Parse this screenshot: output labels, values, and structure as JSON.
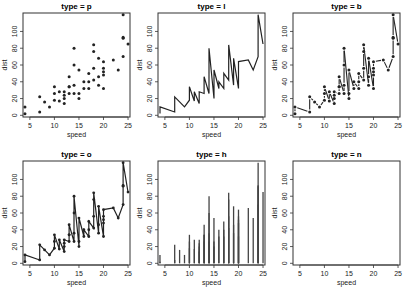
{
  "chart_data": {
    "type": "scatter",
    "dataset": "cars",
    "xlabel": "speed",
    "ylabel": "dist",
    "xlim": [
      4,
      25
    ],
    "ylim": [
      0,
      120
    ],
    "x_ticks": [
      5,
      10,
      15,
      20,
      25
    ],
    "y_ticks": [
      0,
      20,
      40,
      60,
      80,
      100
    ],
    "grid": false,
    "legend": null,
    "speed": [
      4,
      4,
      7,
      7,
      8,
      9,
      10,
      10,
      10,
      11,
      11,
      12,
      12,
      12,
      12,
      13,
      13,
      13,
      13,
      14,
      14,
      14,
      14,
      15,
      15,
      15,
      16,
      16,
      17,
      17,
      17,
      18,
      18,
      18,
      18,
      19,
      19,
      19,
      20,
      20,
      20,
      20,
      20,
      22,
      23,
      24,
      24,
      24,
      24,
      25
    ],
    "dist": [
      2,
      10,
      4,
      22,
      16,
      10,
      18,
      26,
      34,
      17,
      28,
      14,
      20,
      24,
      28,
      26,
      34,
      34,
      46,
      26,
      36,
      60,
      80,
      20,
      26,
      54,
      32,
      40,
      32,
      40,
      50,
      42,
      56,
      76,
      84,
      36,
      46,
      68,
      32,
      48,
      52,
      56,
      64,
      66,
      54,
      70,
      92,
      93,
      120,
      85
    ],
    "panels": [
      {
        "title": "type = p",
        "plot_type": "p",
        "description": "points"
      },
      {
        "title": "type = l",
        "plot_type": "l",
        "description": "lines"
      },
      {
        "title": "type = b",
        "plot_type": "b",
        "description": "both points and lines (broken)"
      },
      {
        "title": "type = o",
        "plot_type": "o",
        "description": "overplotted points and lines"
      },
      {
        "title": "type = h",
        "plot_type": "h",
        "description": "histogram-like vertical lines"
      },
      {
        "title": "type = n",
        "plot_type": "n",
        "description": "no plotting"
      }
    ]
  },
  "style": {
    "line_color": "#222222",
    "point_color": "#222222",
    "box_color": "#333333",
    "background": "#ffffff"
  }
}
